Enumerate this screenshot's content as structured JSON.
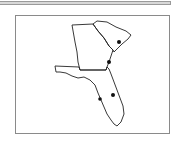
{
  "map": {
    "regions": [
      "Georgia",
      "South Carolina",
      "Florida"
    ],
    "markers": [
      {
        "name": "marker-sc",
        "x": 119,
        "y": 42
      },
      {
        "name": "marker-ga-coast",
        "x": 109,
        "y": 62
      },
      {
        "name": "marker-fl-central",
        "x": 113,
        "y": 95
      },
      {
        "name": "marker-fl-west",
        "x": 100,
        "y": 99
      }
    ],
    "colors": {
      "outline": "#222222",
      "marker": "#111111",
      "frame": "#8a8a8a"
    }
  }
}
